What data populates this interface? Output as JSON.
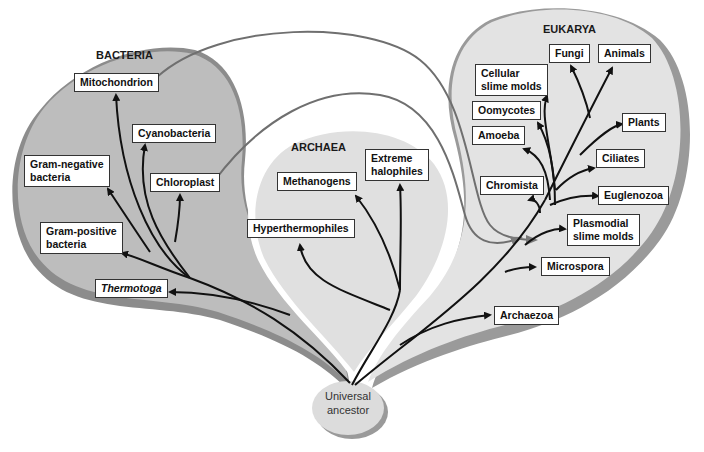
{
  "diagram": {
    "colors": {
      "bacteria_fill": "#bdbdbd",
      "bacteria_shadow": "#8c8c8c",
      "archaea_fill": "#e0e0e0",
      "eukarya_fill": "#e3e3e3",
      "eukarya_shadow": "#9a9a9a",
      "branch": "#111111",
      "endosymbiosis_line": "#6f6f6f",
      "ancestor_fill": "#dcdcdc"
    },
    "domains": [
      {
        "name": "BACTERIA"
      },
      {
        "name": "ARCHAEA"
      },
      {
        "name": "EUKARYA"
      }
    ],
    "root": {
      "line1": "Universal",
      "line2": "ancestor"
    },
    "bacteria": {
      "mitochondrion": "Mitochondrion",
      "cyanobacteria": "Cyanobacteria",
      "gram_negative": [
        "Gram-negative",
        "bacteria"
      ],
      "chloroplast": "Chloroplast",
      "gram_positive": [
        "Gram-positive",
        "bacteria"
      ],
      "thermotoga": "Thermotoga"
    },
    "archaea": {
      "methanogens": "Methanogens",
      "extreme_halophiles": [
        "Extreme",
        "halophiles"
      ],
      "hyperthermophiles": "Hyperthermophiles"
    },
    "eukarya": {
      "fungi": "Fungi",
      "animals": "Animals",
      "cellular_slime_molds": [
        "Cellular",
        "slime molds"
      ],
      "oomycotes": "Oomycotes",
      "plants": "Plants",
      "amoeba": "Amoeba",
      "ciliates": "Ciliates",
      "chromista": "Chromista",
      "euglenozoa": "Euglenozoa",
      "plasmodial_slime_molds": [
        "Plasmodial",
        "slime molds"
      ],
      "microspora": "Microspora",
      "archaezoa": "Archaezoa"
    }
  }
}
